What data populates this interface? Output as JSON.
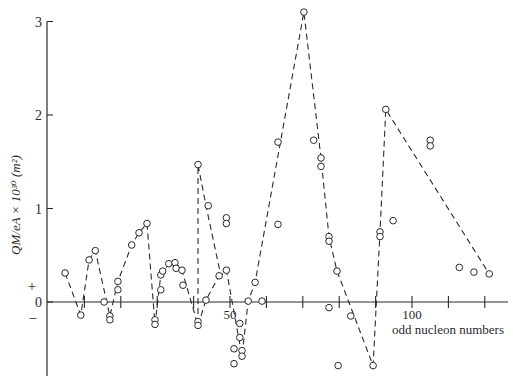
{
  "chart_data": {
    "type": "scatter",
    "title": "",
    "xlabel": "odd nucleon numbers",
    "ylabel": "QM/eA × 10³⁰ (m²)",
    "xlim": [
      0,
      122
    ],
    "ylim": [
      -0.78,
      3.1
    ],
    "x_tick_values": [
      10,
      20,
      30,
      40,
      50,
      60,
      70,
      80,
      90,
      100,
      110,
      120
    ],
    "x_tick_labels": [
      "",
      "",
      "",
      "",
      "50",
      "",
      "",
      "",
      "",
      "100",
      "",
      ""
    ],
    "y_tick_values": [
      0,
      1,
      2,
      3
    ],
    "y_tick_labels": [
      "0",
      "1",
      "2",
      "3"
    ],
    "sign_labels": {
      "plus": "+",
      "minus": "–"
    },
    "grid": false,
    "legend": null,
    "points": [
      [
        4.7,
        0.31
      ],
      [
        9,
        -0.14
      ],
      [
        11.3,
        0.45
      ],
      [
        13,
        0.55
      ],
      [
        15.4,
        0.0
      ],
      [
        17,
        -0.15
      ],
      [
        17,
        -0.19
      ],
      [
        19.2,
        0.13
      ],
      [
        19.2,
        0.22
      ],
      [
        23,
        0.61
      ],
      [
        25,
        0.74
      ],
      [
        27.2,
        0.84
      ],
      [
        29.4,
        -0.19
      ],
      [
        29.4,
        -0.24
      ],
      [
        31,
        0.13
      ],
      [
        31,
        0.29
      ],
      [
        31.5,
        0.33
      ],
      [
        33.2,
        0.41
      ],
      [
        34.9,
        0.42
      ],
      [
        35.2,
        0.36
      ],
      [
        36.8,
        0.34
      ],
      [
        37.1,
        0.18
      ],
      [
        41.2,
        1.47
      ],
      [
        41.2,
        -0.21
      ],
      [
        41.2,
        -0.25
      ],
      [
        43.4,
        0.02
      ],
      [
        44,
        1.03
      ],
      [
        47,
        0.28
      ],
      [
        49,
        0.34
      ],
      [
        49,
        0.9
      ],
      [
        49,
        0.84
      ],
      [
        51.1,
        -0.5
      ],
      [
        51.1,
        -0.66
      ],
      [
        52.7,
        -0.23
      ],
      [
        52.7,
        -0.38
      ],
      [
        53.3,
        -0.52
      ],
      [
        53.3,
        -0.58
      ],
      [
        55,
        0.01
      ],
      [
        56.9,
        0.21
      ],
      [
        58.8,
        0.01
      ],
      [
        63.2,
        1.71
      ],
      [
        63.2,
        0.83
      ],
      [
        70.3,
        3.1
      ],
      [
        73,
        1.73
      ],
      [
        75,
        1.54
      ],
      [
        75,
        1.45
      ],
      [
        77.2,
        0.7
      ],
      [
        77.2,
        0.65
      ],
      [
        79.4,
        0.33
      ],
      [
        77.2,
        -0.06
      ],
      [
        79.7,
        -0.68
      ],
      [
        83.2,
        -0.15
      ],
      [
        89.3,
        -0.68
      ],
      [
        91.2,
        0.75
      ],
      [
        91.2,
        0.7
      ],
      [
        94.8,
        0.87
      ],
      [
        92.8,
        2.06
      ],
      [
        105,
        1.73
      ],
      [
        105,
        1.67
      ],
      [
        113,
        0.37
      ],
      [
        117,
        0.32
      ],
      [
        121.2,
        0.3
      ]
    ],
    "dashed_path": [
      [
        4.7,
        0.31
      ],
      [
        9,
        -0.14
      ],
      [
        11.3,
        0.45
      ],
      [
        13,
        0.55
      ],
      [
        17,
        -0.15
      ],
      [
        19.2,
        0.22
      ],
      [
        23,
        0.61
      ],
      [
        25,
        0.74
      ],
      [
        27.2,
        0.84
      ],
      [
        29.4,
        -0.24
      ],
      [
        31,
        0.29
      ],
      [
        33.2,
        0.41
      ],
      [
        34.9,
        0.42
      ],
      [
        36.8,
        0.34
      ],
      [
        41.2,
        -0.25
      ],
      [
        41.2,
        1.47
      ],
      [
        43.4,
        1.03
      ],
      [
        47.5,
        0.28
      ],
      [
        49,
        0.34
      ],
      [
        53.3,
        -0.58
      ],
      [
        55,
        0.01
      ],
      [
        56.9,
        0.21
      ],
      [
        70.3,
        3.1
      ],
      [
        75,
        1.54
      ],
      [
        77.2,
        0.7
      ],
      [
        79.4,
        0.33
      ],
      [
        89.3,
        -0.68
      ],
      [
        91.2,
        0.75
      ],
      [
        92.8,
        2.06
      ],
      [
        121.2,
        0.3
      ]
    ],
    "dashed_path_2": [
      [
        41.2,
        -0.25
      ],
      [
        43.4,
        0.02
      ],
      [
        47,
        0.28
      ],
      [
        49,
        0.34
      ],
      [
        49,
        0.34
      ]
    ]
  }
}
